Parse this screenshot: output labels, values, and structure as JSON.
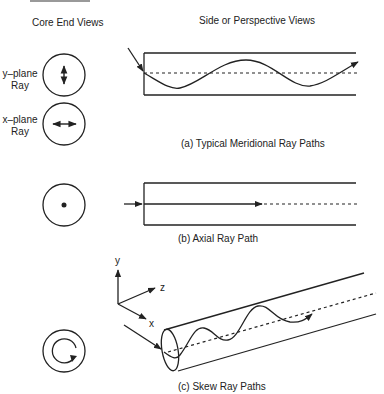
{
  "headers": {
    "left": "Core End Views",
    "right": "Side or Perspective Views"
  },
  "end_view_labels": {
    "y_plane": [
      "y–plane",
      "Ray"
    ],
    "x_plane": [
      "x–plane",
      "Ray"
    ]
  },
  "captions": {
    "a": "(a) Typical Meridional Ray Paths",
    "b": "(b) Axial Ray Path",
    "c": "(c) Skew Ray Paths"
  },
  "axes": {
    "x": "x",
    "y": "y",
    "z": "z"
  },
  "colors": {
    "line": "#222222",
    "background": "#ffffff"
  }
}
